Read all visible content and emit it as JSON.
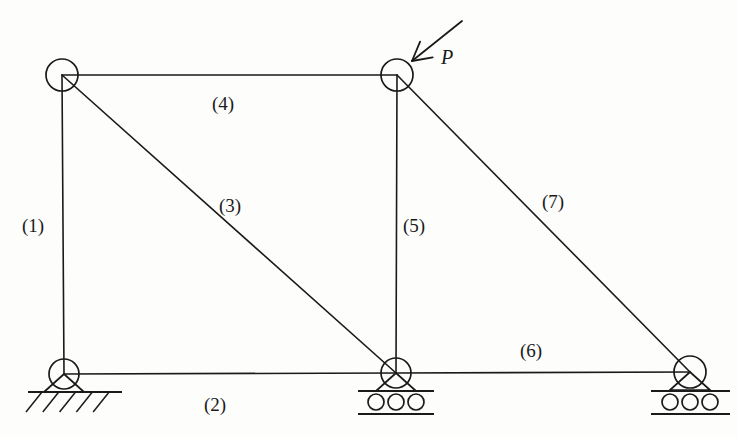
{
  "figure": {
    "kind": "truss-structure-diagram",
    "background_color": "#fdfdfc",
    "line_color": "#1a1a1a",
    "width": 738,
    "height": 437
  },
  "joints": [
    {
      "id": "A",
      "name": "joint-top-left",
      "x": 62,
      "y": 75,
      "radius": 16,
      "support": "pin"
    },
    {
      "id": "B",
      "name": "joint-top-right",
      "x": 397,
      "y": 75,
      "radius": 16,
      "support": "none"
    },
    {
      "id": "C",
      "name": "joint-bottom-left",
      "x": 64,
      "y": 374,
      "radius": 15,
      "support": "pin-fixed"
    },
    {
      "id": "D",
      "name": "joint-bottom-middle",
      "x": 396,
      "y": 373,
      "radius": 15,
      "support": "roller"
    },
    {
      "id": "E",
      "name": "joint-bottom-right",
      "x": 690,
      "y": 372,
      "radius": 16,
      "support": "roller"
    }
  ],
  "members": [
    {
      "label": "(1)",
      "name": "member-1",
      "from": "A",
      "to": "C",
      "label_x": 33,
      "label_y": 232
    },
    {
      "label": "(2)",
      "name": "member-2",
      "from": "C",
      "to": "D",
      "label_x": 215,
      "label_y": 411
    },
    {
      "label": "(3)",
      "name": "member-3",
      "from": "A",
      "to": "D",
      "label_x": 230,
      "label_y": 212
    },
    {
      "label": "(4)",
      "name": "member-4",
      "from": "A",
      "to": "B",
      "label_x": 223,
      "label_y": 110
    },
    {
      "label": "(5)",
      "name": "member-5",
      "from": "B",
      "to": "D",
      "label_x": 414,
      "label_y": 232
    },
    {
      "label": "(6)",
      "name": "member-6",
      "from": "D",
      "to": "E",
      "label_x": 531,
      "label_y": 357
    },
    {
      "label": "(7)",
      "name": "member-7",
      "from": "B",
      "to": "E",
      "label_x": 553,
      "label_y": 208
    }
  ],
  "load": {
    "label": "P",
    "name": "applied-load-P",
    "label_x": 447,
    "label_y": 64,
    "arrow_tail_x": 462,
    "arrow_tail_y": 21,
    "arrow_tip_x": 412,
    "arrow_tip_y": 61
  },
  "supports": {
    "pin_fixed": {
      "name": "pinned-support",
      "ground_y": 392,
      "ground_x1": 28,
      "ground_x2": 122,
      "hatch_count": 5,
      "triangle_half_width": 20,
      "triangle_height": 18
    },
    "roller_middle": {
      "name": "roller-support-middle",
      "plate_y": 391,
      "plate_x1": 358,
      "plate_x2": 434,
      "base_y": 414,
      "base_x1": 358,
      "base_x2": 434,
      "roller_count": 3,
      "roller_radius": 8,
      "triangle_half_width": 20,
      "triangle_height": 18
    },
    "roller_right": {
      "name": "roller-support-right",
      "plate_y": 391,
      "plate_x1": 651,
      "plate_x2": 730,
      "base_y": 414,
      "base_x1": 651,
      "base_x2": 730,
      "roller_count": 3,
      "roller_radius": 8,
      "triangle_half_width": 20,
      "triangle_height": 18
    }
  }
}
